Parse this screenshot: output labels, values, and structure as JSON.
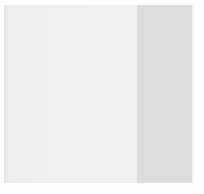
{
  "window": {
    "main_panel": {
      "background": "#efefef"
    },
    "side_panel": {
      "background": "#dcdcdc"
    }
  }
}
